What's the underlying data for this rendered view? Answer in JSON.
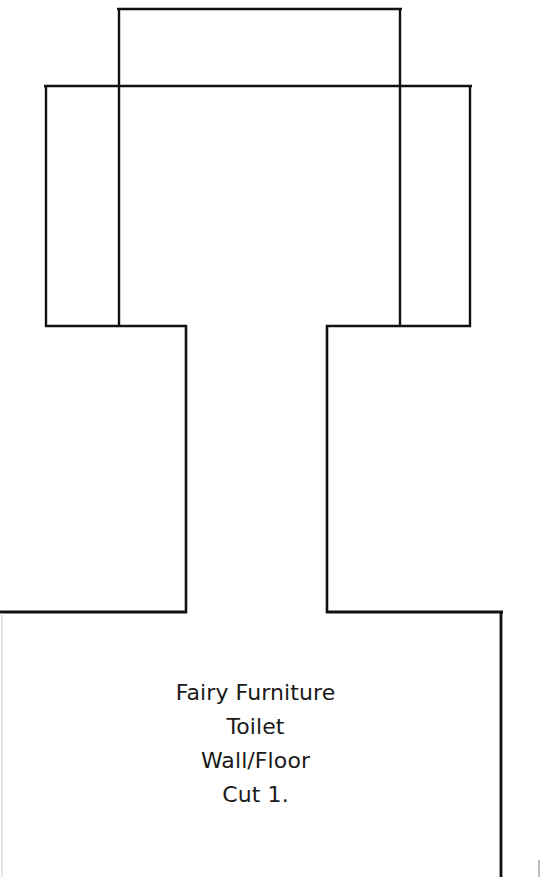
{
  "document": {
    "title": "Fairy Furniture Toilet Wall/Floor Pattern",
    "background_color": "#ffffff",
    "line_color": "#000000",
    "text_color": "#1a1a1a",
    "width": 547,
    "height": 877
  },
  "label": {
    "lines": [
      "Fairy Furniture",
      "Toilet",
      "Wall/Floor",
      "Cut 1."
    ],
    "line1": "Fairy Furniture",
    "line2": "Toilet",
    "line3": "Wall/Floor",
    "line4": "Cut 1.",
    "font_size_px": 22,
    "align": "center"
  },
  "shapes": {
    "upper_rectangle": {
      "name": "upper-tank-rectangle",
      "x1": 118,
      "y1": 8,
      "x2": 401,
      "y2": 326,
      "stroke": "#000000",
      "stroke_width": 2.2,
      "fill": "none"
    },
    "wide_rectangle": {
      "name": "wide-back-rectangle",
      "x1": 45,
      "y1": 85,
      "x2": 471,
      "y2": 326,
      "stroke": "#000000",
      "stroke_width": 2.2,
      "fill": "none"
    },
    "neck": {
      "name": "neck-column",
      "left_x": 186,
      "right_x": 327,
      "top_y": 326,
      "bottom_y": 612,
      "stroke": "#000000",
      "stroke_width": 2.6
    },
    "bottom_rectangle": {
      "name": "floor-base-rectangle",
      "x1": 0,
      "y1": 612,
      "x2": 502,
      "y2": 900,
      "stroke": "#000000",
      "stroke_width": 2.8,
      "fill": "none"
    },
    "corner_tick": {
      "name": "bottom-right-corner-tick",
      "x": 537,
      "y": 862,
      "stroke": "#808080",
      "stroke_width": 1.2
    }
  }
}
